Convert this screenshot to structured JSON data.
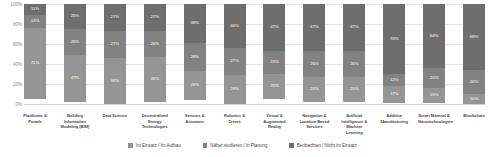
{
  "chart_data": {
    "type": "bar",
    "title": "",
    "subtitle": "",
    "xlabel": "",
    "ylabel": "",
    "ylim": [
      0,
      100
    ],
    "grid": true,
    "stacked": true,
    "stack_mode": "percent",
    "legend_position": "bottom",
    "ticks": [
      "0%",
      "20%",
      "40%",
      "60%",
      "80%",
      "100%"
    ],
    "tick_values": [
      0,
      20,
      40,
      60,
      80,
      100
    ],
    "categories": [
      "Plattforms & Portals",
      "Building Information Modeling (BIM)",
      "Data Science",
      "Decentralized Energy Technologies",
      "Sensors & Actuators",
      "Robotics & Drives",
      "Virtual & Augmented Reality",
      "Navigation & Location Based Services",
      "Artificial Intelligence & Machine Learning",
      "Additive Manufacturing",
      "Smart Material & Nanotechnologien",
      "Blockchain"
    ],
    "series": [
      {
        "name": "Im Einsatz / Im Aufbau",
        "color": "#959595",
        "values": [
          71,
          47,
          46,
          45,
          29,
          29,
          25,
          25,
          25,
          17,
          15,
          10
        ]
      },
      {
        "name": "Näher studieren / In Planung",
        "color": "#828282",
        "values": [
          13,
          26,
          27,
          26,
          28,
          27,
          23,
          26,
          26,
          12,
          20,
          26
        ]
      },
      {
        "name": "Beobachten / Nicht im Einsatz",
        "color": "#6e6e6e",
        "values": [
          11,
          25,
          27,
          27,
          39,
          44,
          47,
          47,
          47,
          70,
          64,
          69
        ]
      }
    ]
  },
  "legend": {
    "items": [
      {
        "label": "Im Einsatz / Im Aufbau",
        "color": "#959595"
      },
      {
        "label": "Näher studieren / In Planung",
        "color": "#828282"
      },
      {
        "label": "Beobachten / Nicht im Einsatz",
        "color": "#6e6e6e"
      }
    ]
  }
}
